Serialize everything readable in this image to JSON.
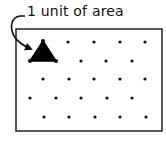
{
  "diagram": {
    "label": "1 unit of area",
    "box": {
      "x1": 16,
      "y1": 29,
      "x2": 162,
      "y2": 131
    },
    "triangle": {
      "points": [
        [
          43,
          41
        ],
        [
          30,
          61
        ],
        [
          56,
          61
        ]
      ],
      "color": "#000000"
    },
    "dot_rows": [
      {
        "y": 42,
        "xs": [
          68,
          94,
          120,
          145
        ]
      },
      {
        "y": 61,
        "xs": [
          81,
          106,
          132
        ]
      },
      {
        "y": 79,
        "xs": [
          43,
          69,
          94,
          120,
          145
        ]
      },
      {
        "y": 98,
        "xs": [
          30,
          56,
          81,
          107,
          132
        ]
      },
      {
        "y": 117,
        "xs": [
          44,
          69,
          95,
          120,
          146
        ]
      }
    ]
  }
}
